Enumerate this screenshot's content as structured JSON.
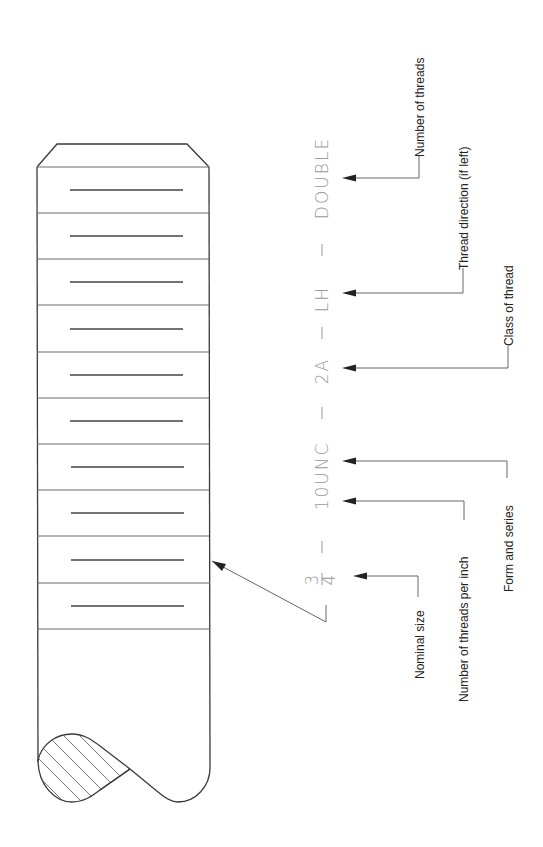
{
  "diagram": {
    "callout": {
      "nominal_size_numerator": "3",
      "nominal_size_denominator": "4",
      "threads_form": "10UNC",
      "class": "2A",
      "direction": "LH",
      "threads": "DOUBLE",
      "separator": "—"
    },
    "labels": {
      "nominal_size": "Nominal size",
      "threads_per_inch": "Number of threads per inch",
      "form_and_series": "Form and series",
      "class_of_thread": "Class of thread",
      "thread_direction": "Thread direction (if left)",
      "number_of_threads": "Number of threads"
    },
    "colors": {
      "outline": "#3a3a3a",
      "callout_text": "#9a9a9a",
      "label_text": "#222222"
    }
  }
}
